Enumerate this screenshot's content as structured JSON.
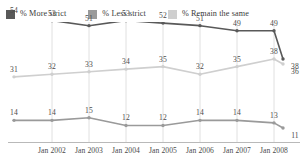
{
  "legend": {
    "items": [
      {
        "label": "% More strict",
        "color": "#595959",
        "icon": "legend-swatch-icon"
      },
      {
        "label": "% Less strict",
        "color": "#9a9a9a",
        "icon": "legend-swatch-icon"
      },
      {
        "label": "% Remain the same",
        "color": "#cfcfcf",
        "icon": "legend-swatch-icon"
      }
    ]
  },
  "chart_data": {
    "type": "line",
    "title": "",
    "subtitle": "",
    "xlabel": "",
    "ylabel": "",
    "grid": "vertical",
    "legend_position": "top-left",
    "ylim": [
      0,
      60
    ],
    "categories": [
      "",
      "Jan 2002",
      "Jan 2003",
      "Jan 2004",
      "Jan 2005",
      "Jan 2006",
      "Jan 2007",
      "Jan 2008"
    ],
    "tick_labels": [
      "Jan 2002",
      "Jan 2003",
      "Jan 2004",
      "Jan 2005",
      "Jan 2006",
      "Jan 2007",
      "Jan 2008"
    ],
    "series": [
      {
        "name": "% More strict",
        "color": "#595959",
        "values": [
          54,
          53,
          51,
          53,
          52,
          51,
          49,
          49
        ],
        "labels": [
          "54",
          "53",
          "51",
          "53",
          "52",
          "51",
          "49",
          "49"
        ],
        "end_value": 38,
        "end_label": "38"
      },
      {
        "name": "% Remain the same",
        "color": "#cfcfcf",
        "values": [
          31,
          32,
          33,
          34,
          35,
          32,
          35,
          38
        ],
        "labels": [
          "31",
          "32",
          "33",
          "34",
          "35",
          "32",
          "35",
          "38"
        ],
        "end_value": 36,
        "end_label": "36"
      },
      {
        "name": "% Less strict",
        "color": "#9a9a9a",
        "values": [
          14,
          14,
          15,
          12,
          12,
          14,
          14,
          13
        ],
        "labels": [
          "14",
          "14",
          "15",
          "12",
          "12",
          "14",
          "14",
          "13"
        ],
        "end_value": 11,
        "end_label": "11"
      }
    ]
  }
}
